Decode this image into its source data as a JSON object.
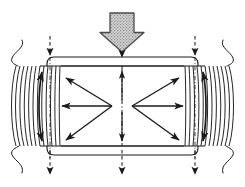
{
  "figure": {
    "width": 245,
    "height": 187,
    "background_color": "#ffffff",
    "line_color": "#1a1a1a",
    "stipple_fill_color": "#c8c8c8",
    "stipple_dot_color": "#8a8a8a"
  },
  "elements": {
    "load_arrow": {
      "name": "applied-load-arrow",
      "style": "hollow-outlined-block-arrow",
      "fill": "stippled-gray",
      "direction": "down",
      "x_center": 122,
      "y_top": 13,
      "y_tip": 52,
      "shaft_half_width": 12,
      "head_half_width": 22
    },
    "top_platen": {
      "name": "top-platen-plate",
      "x_left": 40,
      "x_right": 205,
      "y_top": 57,
      "y_bottom": 66,
      "corner_radius": 7
    },
    "bottom_platen": {
      "name": "bottom-platen-plate",
      "x_left": 40,
      "x_right": 205,
      "y_top": 146,
      "y_bottom": 155,
      "corner_radius": 7
    },
    "left_field_band": {
      "name": "left-confinement-field-lines",
      "x_start": 14,
      "x_end": 60,
      "y_top": 66,
      "y_bottom": 146,
      "line_count": 12,
      "bulge": "outward-left"
    },
    "right_field_band": {
      "name": "right-confinement-field-lines",
      "x_start": 185,
      "x_end": 231,
      "y_top": 66,
      "y_bottom": 146,
      "line_count": 12,
      "bulge": "outward-right"
    },
    "left_vertical_double_arrow": {
      "name": "left-vertical-double-arrow",
      "x": 42,
      "y_top": 72,
      "y_bottom": 141
    },
    "right_vertical_double_arrow": {
      "name": "right-vertical-double-arrow",
      "x": 203,
      "y_top": 72,
      "y_bottom": 141
    },
    "center_line": {
      "name": "vertical-centerline",
      "style": "dash-dot",
      "x": 122,
      "y_top": 66,
      "y_bottom": 146,
      "arrow_up": true,
      "arrow_down": true
    },
    "radiating_arrows": {
      "name": "lateral-expansion-arrows",
      "left_node": {
        "x": 112,
        "y": 106
      },
      "right_node": {
        "x": 132,
        "y": 106
      },
      "count": 6,
      "directions": [
        "up-left",
        "left",
        "down-left",
        "up-right",
        "right",
        "down-right"
      ]
    },
    "top_dashed_arrows": {
      "name": "top-load-transfer-arrows",
      "style": "dashed-with-solid-head",
      "direction": "down",
      "x_positions": [
        50,
        122,
        195
      ],
      "y_start": 38,
      "y_end": 57
    },
    "bottom_dashed_arrows": {
      "name": "bottom-reaction-arrows",
      "style": "dashed-with-solid-head",
      "direction": "down",
      "x_positions": [
        50,
        122,
        195
      ],
      "y_start": 146,
      "y_end": 178
    },
    "break_lines": {
      "name": "section-break-lines",
      "left_x": 22,
      "right_x": 223,
      "description": "squiggly cut lines at outer edges top and bottom"
    }
  }
}
